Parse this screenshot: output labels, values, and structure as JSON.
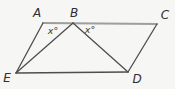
{
  "diagram": {
    "background": "#f6f6f4",
    "line_color": "#4e4e4e",
    "top_edge_color": "#9e9e9e",
    "points": {
      "A": {
        "x": 43,
        "y": 23
      },
      "B": {
        "x": 73,
        "y": 23
      },
      "C": {
        "x": 157,
        "y": 24
      },
      "D": {
        "x": 128,
        "y": 72
      },
      "E": {
        "x": 16,
        "y": 73
      }
    },
    "segments": [
      {
        "from": "A",
        "to": "C",
        "role": "top-edge"
      },
      {
        "from": "E",
        "to": "D",
        "role": "bottom-edge"
      },
      {
        "from": "A",
        "to": "E",
        "role": "left-edge"
      },
      {
        "from": "C",
        "to": "D",
        "role": "right-edge"
      },
      {
        "from": "B",
        "to": "E",
        "role": "cevian"
      },
      {
        "from": "B",
        "to": "D",
        "role": "cevian"
      }
    ],
    "vertex_labels": {
      "A": {
        "text": "A",
        "x": 37,
        "y": 13
      },
      "B": {
        "text": "B",
        "x": 74,
        "y": 13
      },
      "C": {
        "text": "C",
        "x": 165,
        "y": 15
      },
      "D": {
        "text": "D",
        "x": 137,
        "y": 79
      },
      "E": {
        "text": "E",
        "x": 7,
        "y": 78
      }
    },
    "angle_labels": {
      "left": {
        "text": "x°",
        "x": 53,
        "y": 31
      },
      "right": {
        "text": "x°",
        "x": 90,
        "y": 30
      }
    }
  }
}
